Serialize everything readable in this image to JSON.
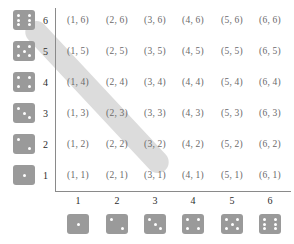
{
  "figure": {
    "type": "sample-space-grid",
    "highlight": {
      "label": "sum-equals-8-diagonal",
      "color": "#dcdcdc",
      "cells": [
        "(2, 6)",
        "(3, 5)",
        "(4, 4)",
        "(5, 3)",
        "(6, 2)"
      ]
    },
    "colors": {
      "die_face": "#9a9a9a",
      "die_pip": "#ffffff",
      "cell_text": "#6a6a6a",
      "axis": "#8a8a8a",
      "label_text": "#2b2b2b",
      "band": "#dcdcdc"
    }
  },
  "axes": {
    "x_tick_labels": [
      "1",
      "2",
      "3",
      "4",
      "5",
      "6"
    ],
    "y_tick_labels": [
      "6",
      "5",
      "4",
      "3",
      "2",
      "1"
    ]
  },
  "dice": {
    "left_column_values": [
      6,
      5,
      4,
      3,
      2,
      1
    ],
    "bottom_row_values": [
      1,
      2,
      3,
      4,
      5,
      6
    ]
  },
  "grid": {
    "rows": [
      {
        "y": "6",
        "cells": [
          "(1, 6)",
          "(2, 6)",
          "(3, 6)",
          "(4, 6)",
          "(5, 6)",
          "(6, 6)"
        ]
      },
      {
        "y": "5",
        "cells": [
          "(1, 5)",
          "(2, 5)",
          "(3, 5)",
          "(4, 5)",
          "(5, 5)",
          "(6, 5)"
        ]
      },
      {
        "y": "4",
        "cells": [
          "(1, 4)",
          "(2, 4)",
          "(3, 4)",
          "(4, 4)",
          "(5, 4)",
          "(6, 4)"
        ]
      },
      {
        "y": "3",
        "cells": [
          "(1, 3)",
          "(2, 3)",
          "(3, 3)",
          "(4, 3)",
          "(5, 3)",
          "(6, 3)"
        ]
      },
      {
        "y": "2",
        "cells": [
          "(1, 2)",
          "(2, 2)",
          "(3, 2)",
          "(4, 2)",
          "(5, 2)",
          "(6, 2)"
        ]
      },
      {
        "y": "1",
        "cells": [
          "(1, 1)",
          "(2, 1)",
          "(3, 1)",
          "(4, 1)",
          "(5, 1)",
          "(6, 1)"
        ]
      }
    ]
  }
}
